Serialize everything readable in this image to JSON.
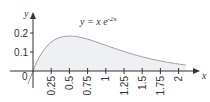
{
  "chart_data": {
    "type": "area",
    "title": "",
    "annotation": "y = x e^{-2x}",
    "annotation_parts": {
      "base": "y = x e",
      "exponent": "-2x"
    },
    "xlabel": "x",
    "ylabel": "y",
    "origin_label": "0",
    "xlim": [
      0,
      2.25
    ],
    "ylim": [
      0,
      0.25
    ],
    "grid": false,
    "legend": "none",
    "x_ticks": [
      "0.25",
      "0.5",
      "0.75",
      "1",
      "1.25",
      "1.5",
      "1.75",
      "2"
    ],
    "y_ticks": [
      "0.1",
      "0.2"
    ],
    "series": [
      {
        "name": "y = x e^{-2x}",
        "x": [
          0,
          0.1,
          0.25,
          0.5,
          0.75,
          1,
          1.25,
          1.5,
          1.75,
          2,
          2.1
        ],
        "values": [
          0,
          0.082,
          0.152,
          0.184,
          0.167,
          0.135,
          0.103,
          0.075,
          0.053,
          0.037,
          0.031
        ]
      }
    ],
    "colors": {
      "curve": "#9a9a9a",
      "fill": "#eef0f4",
      "axis": "#333333"
    }
  }
}
